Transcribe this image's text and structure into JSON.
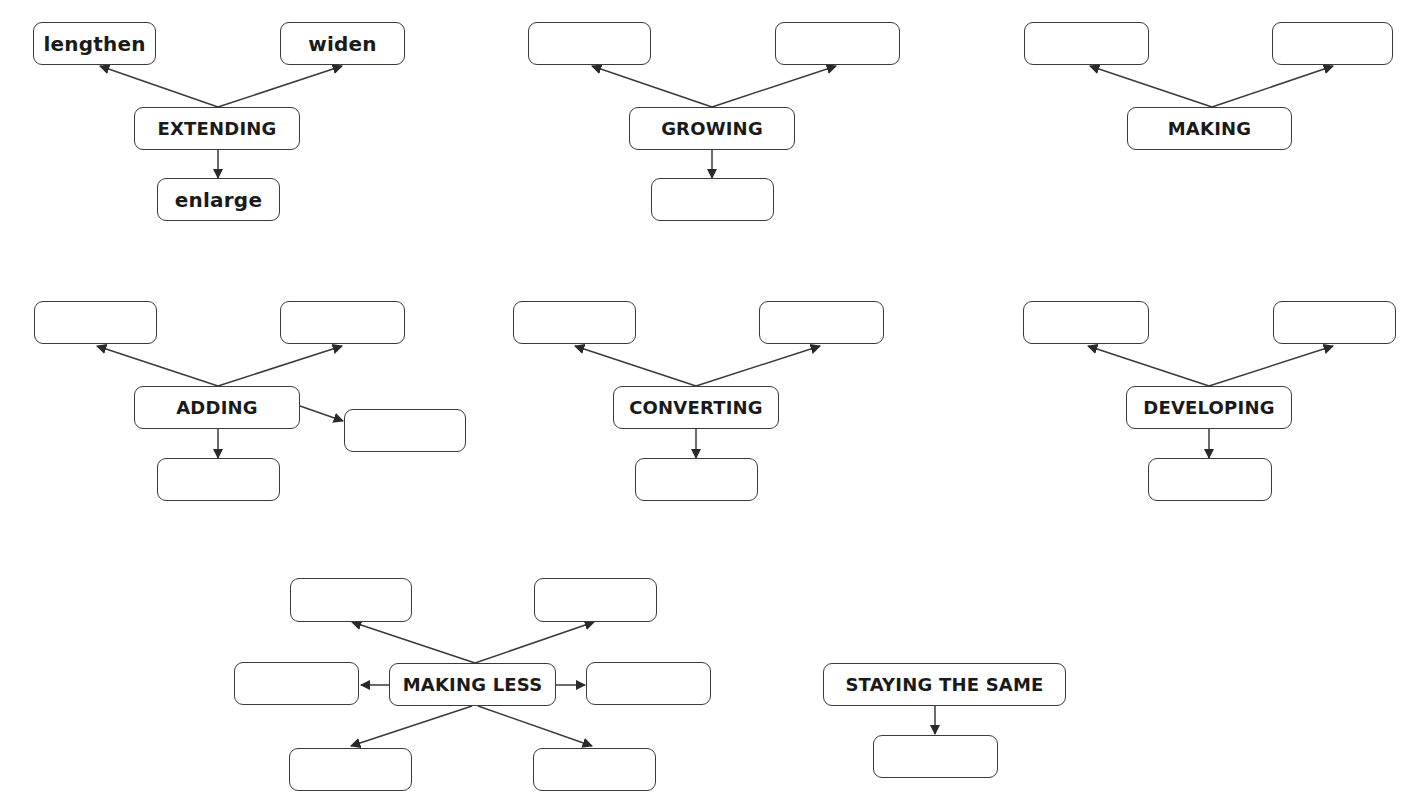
{
  "header": {
    "title_clipped": ""
  },
  "colors": {
    "stroke": "#3a3a3a",
    "text": "#1a1a1a",
    "background": "#ffffff"
  },
  "diagrams": [
    {
      "id": "extending",
      "hub": {
        "label": "EXTENDING",
        "x": 134,
        "y": 107,
        "w": 166,
        "h": 43
      },
      "leaves": [
        {
          "label": "lengthen",
          "x": 33,
          "y": 22,
          "w": 123,
          "h": 43
        },
        {
          "label": "widen",
          "x": 280,
          "y": 22,
          "w": 125,
          "h": 43
        },
        {
          "label": "enlarge",
          "x": 157,
          "y": 178,
          "w": 123,
          "h": 43
        }
      ]
    },
    {
      "id": "growing",
      "hub": {
        "label": "GROWING",
        "x": 629,
        "y": 107,
        "w": 166,
        "h": 43
      },
      "leaves": [
        {
          "label": "",
          "x": 528,
          "y": 22,
          "w": 123,
          "h": 43
        },
        {
          "label": "",
          "x": 775,
          "y": 22,
          "w": 125,
          "h": 43
        },
        {
          "label": "",
          "x": 651,
          "y": 178,
          "w": 123,
          "h": 43
        }
      ]
    },
    {
      "id": "making",
      "hub": {
        "label": "MAKING",
        "x": 1127,
        "y": 107,
        "w": 165,
        "h": 43
      },
      "leaves": [
        {
          "label": "",
          "x": 1024,
          "y": 22,
          "w": 125,
          "h": 43
        },
        {
          "label": "",
          "x": 1272,
          "y": 22,
          "w": 121,
          "h": 43
        }
      ]
    },
    {
      "id": "adding",
      "hub": {
        "label": "ADDING",
        "x": 134,
        "y": 386,
        "w": 166,
        "h": 43
      },
      "leaves": [
        {
          "label": "",
          "x": 34,
          "y": 301,
          "w": 123,
          "h": 43
        },
        {
          "label": "",
          "x": 280,
          "y": 301,
          "w": 125,
          "h": 43
        },
        {
          "label": "",
          "x": 344,
          "y": 409,
          "w": 122,
          "h": 43
        },
        {
          "label": "",
          "x": 157,
          "y": 458,
          "w": 123,
          "h": 43
        }
      ]
    },
    {
      "id": "converting",
      "hub": {
        "label": "CONVERTING",
        "x": 613,
        "y": 386,
        "w": 166,
        "h": 43
      },
      "leaves": [
        {
          "label": "",
          "x": 513,
          "y": 301,
          "w": 123,
          "h": 43
        },
        {
          "label": "",
          "x": 759,
          "y": 301,
          "w": 125,
          "h": 43
        },
        {
          "label": "",
          "x": 635,
          "y": 458,
          "w": 123,
          "h": 43
        }
      ]
    },
    {
      "id": "developing",
      "hub": {
        "label": "DEVELOPING",
        "x": 1126,
        "y": 386,
        "w": 166,
        "h": 43
      },
      "leaves": [
        {
          "label": "",
          "x": 1023,
          "y": 301,
          "w": 126,
          "h": 43
        },
        {
          "label": "",
          "x": 1273,
          "y": 301,
          "w": 123,
          "h": 43
        },
        {
          "label": "",
          "x": 1148,
          "y": 458,
          "w": 124,
          "h": 43
        }
      ]
    },
    {
      "id": "making-less",
      "hub": {
        "label": "MAKING LESS",
        "x": 389,
        "y": 663,
        "w": 167,
        "h": 43
      },
      "leaves": [
        {
          "label": "",
          "x": 290,
          "y": 578,
          "w": 122,
          "h": 44
        },
        {
          "label": "",
          "x": 534,
          "y": 578,
          "w": 123,
          "h": 44
        },
        {
          "label": "",
          "x": 234,
          "y": 662,
          "w": 125,
          "h": 43
        },
        {
          "label": "",
          "x": 586,
          "y": 662,
          "w": 125,
          "h": 43
        },
        {
          "label": "",
          "x": 289,
          "y": 748,
          "w": 123,
          "h": 43
        },
        {
          "label": "",
          "x": 533,
          "y": 748,
          "w": 123,
          "h": 43
        }
      ]
    },
    {
      "id": "staying-the-same",
      "hub": {
        "label": "STAYING THE SAME",
        "x": 823,
        "y": 663,
        "w": 243,
        "h": 43
      },
      "leaves": [
        {
          "label": "",
          "x": 873,
          "y": 735,
          "w": 125,
          "h": 43
        }
      ]
    }
  ],
  "arrows": [
    {
      "from": [
        218,
        107
      ],
      "to": [
        100,
        66
      ]
    },
    {
      "from": [
        218,
        107
      ],
      "to": [
        342,
        66
      ]
    },
    {
      "from": [
        218,
        150
      ],
      "to": [
        218,
        178
      ]
    },
    {
      "from": [
        712,
        107
      ],
      "to": [
        592,
        66
      ]
    },
    {
      "from": [
        712,
        107
      ],
      "to": [
        836,
        66
      ]
    },
    {
      "from": [
        712,
        150
      ],
      "to": [
        712,
        178
      ]
    },
    {
      "from": [
        1212,
        107
      ],
      "to": [
        1090,
        66
      ]
    },
    {
      "from": [
        1212,
        107
      ],
      "to": [
        1333,
        66
      ]
    },
    {
      "from": [
        218,
        386
      ],
      "to": [
        97,
        346
      ]
    },
    {
      "from": [
        218,
        386
      ],
      "to": [
        342,
        346
      ]
    },
    {
      "from": [
        300,
        406
      ],
      "to": [
        343,
        421
      ]
    },
    {
      "from": [
        218,
        429
      ],
      "to": [
        218,
        458
      ]
    },
    {
      "from": [
        696,
        386
      ],
      "to": [
        575,
        346
      ]
    },
    {
      "from": [
        696,
        386
      ],
      "to": [
        820,
        346
      ]
    },
    {
      "from": [
        696,
        429
      ],
      "to": [
        696,
        458
      ]
    },
    {
      "from": [
        1209,
        386
      ],
      "to": [
        1088,
        346
      ]
    },
    {
      "from": [
        1209,
        386
      ],
      "to": [
        1333,
        346
      ]
    },
    {
      "from": [
        1209,
        429
      ],
      "to": [
        1209,
        458
      ]
    },
    {
      "from": [
        475,
        663
      ],
      "to": [
        352,
        622
      ]
    },
    {
      "from": [
        475,
        663
      ],
      "to": [
        594,
        622
      ]
    },
    {
      "from": [
        389,
        685
      ],
      "to": [
        361,
        685
      ]
    },
    {
      "from": [
        556,
        685
      ],
      "to": [
        585,
        685
      ]
    },
    {
      "from": [
        472,
        706
      ],
      "to": [
        351,
        746
      ]
    },
    {
      "from": [
        478,
        706
      ],
      "to": [
        592,
        746
      ]
    },
    {
      "from": [
        935,
        706
      ],
      "to": [
        935,
        734
      ]
    }
  ]
}
